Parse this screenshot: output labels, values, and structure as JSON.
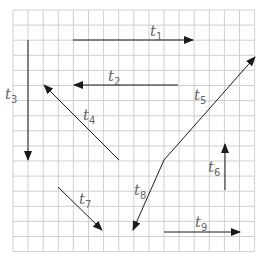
{
  "diagram": {
    "type": "vector-grid",
    "grid": {
      "left": 13,
      "top": 10,
      "cell": 15.1,
      "cols": 16,
      "rows": 16,
      "line_color": "#cfcfcf"
    },
    "arrow_color": "#1a1a1a",
    "vectors": [
      {
        "id": "t1",
        "letter": "t",
        "sub": "1",
        "x1": 73,
        "y1": 40,
        "x2": 193,
        "y2": 40,
        "lx": 150,
        "ly": 36
      },
      {
        "id": "t2",
        "letter": "t",
        "sub": "2",
        "x1": 178,
        "y1": 85,
        "x2": 74,
        "y2": 85,
        "lx": 108,
        "ly": 81
      },
      {
        "id": "t3",
        "letter": "t",
        "sub": "3",
        "x1": 28,
        "y1": 40,
        "x2": 28,
        "y2": 160,
        "lx": 5,
        "ly": 99
      },
      {
        "id": "t4",
        "letter": "t",
        "sub": "4",
        "x1": 119,
        "y1": 160,
        "x2": 44,
        "y2": 85,
        "lx": 83,
        "ly": 120
      },
      {
        "id": "t5",
        "letter": "t",
        "sub": "5",
        "x1": 164,
        "y1": 160,
        "x2": 255,
        "y2": 57,
        "lx": 194,
        "ly": 100
      },
      {
        "id": "t6",
        "letter": "t",
        "sub": "6",
        "x1": 225,
        "y1": 190,
        "x2": 225,
        "y2": 144,
        "lx": 208,
        "ly": 172
      },
      {
        "id": "t7",
        "letter": "t",
        "sub": "7",
        "x1": 58,
        "y1": 187,
        "x2": 102,
        "y2": 230,
        "lx": 79,
        "ly": 204
      },
      {
        "id": "t8",
        "letter": "t",
        "sub": "8",
        "x1": 164,
        "y1": 160,
        "x2": 133,
        "y2": 230,
        "lx": 134,
        "ly": 195
      },
      {
        "id": "t9",
        "letter": "t",
        "sub": "9",
        "x1": 164,
        "y1": 232,
        "x2": 240,
        "y2": 232,
        "lx": 195,
        "ly": 227
      }
    ]
  }
}
